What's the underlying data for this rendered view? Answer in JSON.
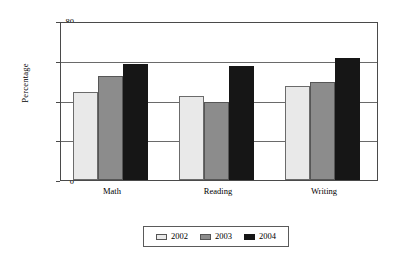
{
  "chart_data": {
    "type": "bar",
    "title": "",
    "subtitle": "",
    "xlabel": "",
    "ylabel": "Percentage",
    "categories": [
      "Math",
      "Reading",
      "Writing"
    ],
    "series": [
      {
        "name": "2002",
        "color": "#e9e9e9",
        "values": [
          45,
          43,
          48
        ]
      },
      {
        "name": "2003",
        "color": "#8c8c8c",
        "values": [
          53,
          40,
          50
        ]
      },
      {
        "name": "2004",
        "color": "#161616",
        "values": [
          59,
          58,
          62
        ]
      }
    ],
    "ylim": [
      0,
      80
    ],
    "yticks": [
      0,
      20,
      40,
      60,
      80
    ],
    "ytick_labels": [
      "0",
      "20",
      "40",
      "60",
      "80"
    ],
    "grid": true,
    "grid_axis": "y",
    "legend_position": "bottom",
    "legend_entries": [
      "2002",
      "2003",
      "2004"
    ],
    "bar_group_gap": true,
    "bars_adjacent_within_group": true
  },
  "axis": {
    "y_title": "Percentage",
    "ticks": [
      {
        "label": "80",
        "value": 80
      },
      {
        "label": "60",
        "value": 60
      },
      {
        "label": "40",
        "value": 40
      },
      {
        "label": "20",
        "value": 20
      },
      {
        "label": "0",
        "value": 0
      }
    ]
  },
  "categories": [
    {
      "label": "Math"
    },
    {
      "label": "Reading"
    },
    {
      "label": "Writing"
    }
  ],
  "legend": {
    "items": [
      {
        "label": "2002",
        "color": "#e9e9e9"
      },
      {
        "label": "2003",
        "color": "#8c8c8c"
      },
      {
        "label": "2004",
        "color": "#161616"
      }
    ]
  }
}
